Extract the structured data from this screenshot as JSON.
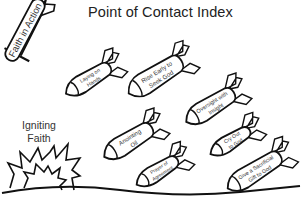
{
  "title": "Point of Contact Index",
  "plane": {
    "label": "Faith in Action"
  },
  "explosion": {
    "label_line1": "Igniting",
    "label_line2": "Faith"
  },
  "bombs": [
    {
      "id": "laying-on-hands",
      "line1": "Laying on",
      "line2": "Hands"
    },
    {
      "id": "rise-early",
      "line1": "Rise Early to",
      "line2": "Seek God"
    },
    {
      "id": "oversight",
      "line1": "Oversight with",
      "line2": "Insight"
    },
    {
      "id": "anointing-oil",
      "line1": "Anointing",
      "line2": "Oil"
    },
    {
      "id": "prayer-agreement",
      "line1": "Prayer of",
      "line2": "Agreement"
    },
    {
      "id": "cry-out",
      "line1": "Cry Out",
      "line2": "to God"
    },
    {
      "id": "sacrificial-gift",
      "line1": "Give a Sacrificial",
      "line2": "Gift to God"
    }
  ],
  "colors": {
    "ink": "#111111",
    "text": "#333333",
    "background": "#ffffff"
  }
}
